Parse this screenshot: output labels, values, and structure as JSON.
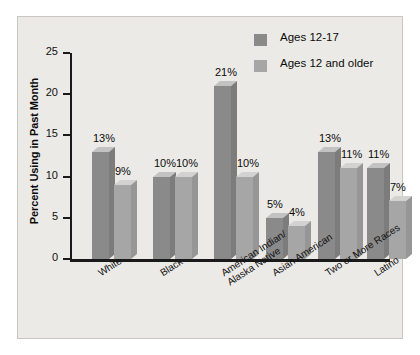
{
  "chart_data": {
    "type": "bar",
    "title": "",
    "subtitle": "",
    "xlabel": "",
    "ylabel": "Percent Using in Past Month",
    "ylim": [
      0,
      25
    ],
    "yticks": [
      0,
      5,
      10,
      15,
      20,
      25
    ],
    "ytick_labels": [
      "0",
      "5",
      "10",
      "15",
      "20",
      "25"
    ],
    "grid": false,
    "legend_position": "top-right",
    "categories": [
      "White",
      "Black",
      "American Indian/ Alaska Native",
      "Asian American",
      "Two or More Races",
      "Latino"
    ],
    "category_lines": [
      [
        "White"
      ],
      [
        "Black"
      ],
      [
        "American Indian/",
        "Alaska Native"
      ],
      [
        "Asian American"
      ],
      [
        "Two or More Races"
      ],
      [
        "Latino"
      ]
    ],
    "series": [
      {
        "name": "Ages 12-17",
        "color": "#8a8a8a",
        "values": [
          13,
          10,
          21,
          5,
          13,
          11
        ],
        "labels": [
          "13%",
          "10%",
          "21%",
          "5%",
          "13%",
          "11%"
        ]
      },
      {
        "name": "Ages 12 and older",
        "color": "#a6a6a6",
        "values": [
          9,
          10,
          10,
          4,
          11,
          7
        ],
        "labels": [
          "9%",
          "10%",
          "10%",
          "4%",
          "11%",
          "7%"
        ]
      }
    ]
  },
  "legend": {
    "items": [
      {
        "label": "Ages 12-17",
        "color": "#8a8a8a"
      },
      {
        "label": "Ages 12 and older",
        "color": "#a6a6a6"
      }
    ]
  },
  "colors": {
    "panel_background": "#eceae7",
    "panel_border": "#c9c6c2",
    "axis": "#1a1a1a",
    "text": "#0a0a0a",
    "series_1_front": "#8a8a8a",
    "series_1_side": "#7c7c7c",
    "series_1_top": "#c2c2c2",
    "series_2_front": "#a6a6a6",
    "series_2_side": "#969696",
    "series_2_top": "#d2d2d2"
  }
}
